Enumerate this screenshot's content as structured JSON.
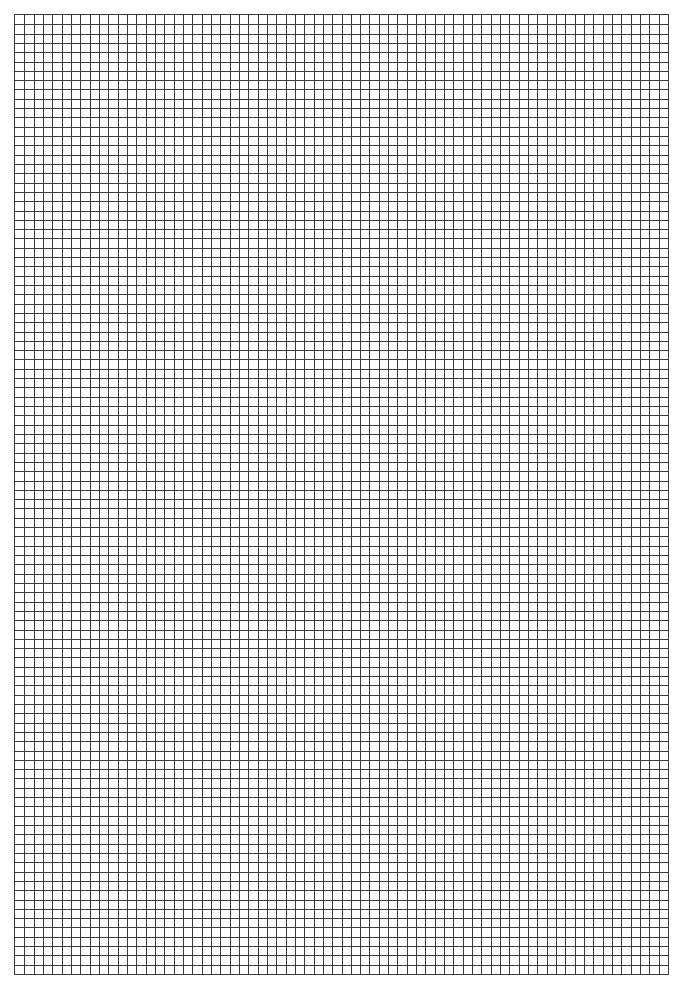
{
  "document": {
    "type": "graph-paper",
    "grid": {
      "columns": 70,
      "rows": 103,
      "line_color": "#3a3a3a",
      "background_color": "#ffffff"
    }
  }
}
